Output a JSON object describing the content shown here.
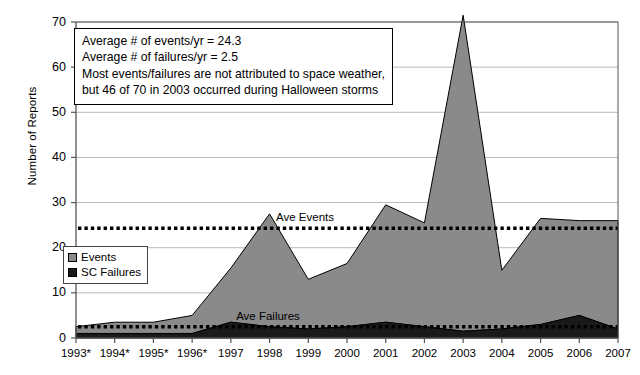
{
  "chart_data": {
    "type": "area",
    "title": "",
    "xlabel": "",
    "ylabel": "Number of Reports",
    "ylim": [
      0,
      70
    ],
    "yticks": [
      0,
      10,
      20,
      30,
      40,
      50,
      60,
      70
    ],
    "grid": true,
    "stacked": true,
    "legend_position": "inside-lower-left",
    "categories": [
      "1993*",
      "1994*",
      "1995*",
      "1996*",
      "1997",
      "1998",
      "1999",
      "2000",
      "2001",
      "2002",
      "2003",
      "2004",
      "2005",
      "2006",
      "2007"
    ],
    "series": [
      {
        "name": "Events",
        "color": "#8a8a8a",
        "values": [
          1.5,
          2.5,
          2.5,
          4.0,
          12.0,
          25.0,
          11.0,
          14.0,
          26.0,
          23.0,
          70.0,
          13.0,
          23.5,
          21.0,
          24.0
        ]
      },
      {
        "name": "SC Failures",
        "color": "#1a1a1a",
        "values": [
          1.0,
          1.0,
          1.0,
          1.0,
          3.5,
          2.5,
          2.0,
          2.5,
          3.5,
          2.5,
          1.5,
          2.0,
          3.0,
          5.0,
          2.0
        ]
      }
    ],
    "reference_lines": [
      {
        "name": "Ave Events",
        "label": "Ave Events",
        "value": 24.3,
        "style": "dotted",
        "color": "#000000"
      },
      {
        "name": "Ave Failures",
        "label": "Ave Failures",
        "value": 2.5,
        "style": "dotted",
        "color": "#000000"
      }
    ],
    "annotation": {
      "lines": [
        "Average # of events/yr = 24.3",
        "Average # of failures/yr = 2.5",
        "Most events/failures are not attributed to space weather,",
        "but 46 of 70 in 2003 occurred during Halloween storms"
      ]
    }
  },
  "legend": {
    "items": [
      {
        "label": "Events",
        "color": "#8a8a8a"
      },
      {
        "label": "SC Failures",
        "color": "#1a1a1a"
      }
    ]
  },
  "colors": {
    "events_fill": "#8a8a8a",
    "failures_fill": "#1a1a1a",
    "axis": "#555555",
    "gridline": "#b9b9b9",
    "reference_line": "#000000",
    "background": "#ffffff"
  }
}
